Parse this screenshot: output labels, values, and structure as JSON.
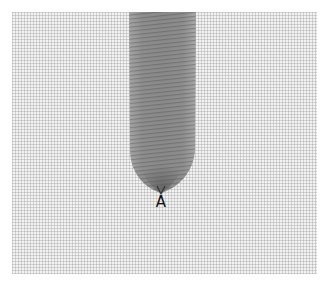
{
  "figure": {
    "label_point": "A",
    "colors": {
      "background": "#ffffff",
      "fabric_base": "#f2f2f2",
      "fabric_thread": "#969696",
      "strip_fill": "#8c8c8c",
      "strip_dark": "#6e6e6e",
      "label_color": "#111111"
    }
  }
}
